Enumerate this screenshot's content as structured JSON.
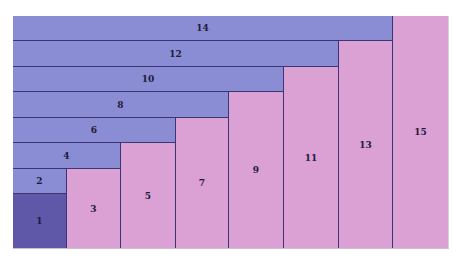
{
  "diagram": {
    "type": "geometric-series-proof",
    "colors": {
      "bar": "#8a8dd4",
      "column": "#dba0d4",
      "square": "#5f57a8",
      "border": "#3b3673"
    },
    "grid": {
      "columns": 8,
      "rows": 9
    },
    "square": {
      "label": "1"
    },
    "bars": [
      {
        "label": "14",
        "span_cols": 7,
        "row": 0
      },
      {
        "label": "12",
        "span_cols": 6,
        "row": 1
      },
      {
        "label": "10",
        "span_cols": 5,
        "row": 2
      },
      {
        "label": "8",
        "span_cols": 4,
        "row": 3
      },
      {
        "label": "6",
        "span_cols": 3,
        "row": 4
      },
      {
        "label": "4",
        "span_cols": 2,
        "row": 5
      },
      {
        "label": "2",
        "span_cols": 1,
        "row": 6
      }
    ],
    "columns": [
      {
        "label": "3",
        "col": 1,
        "top_row": 6
      },
      {
        "label": "5",
        "col": 2,
        "top_row": 5
      },
      {
        "label": "7",
        "col": 3,
        "top_row": 4
      },
      {
        "label": "9",
        "col": 4,
        "top_row": 3
      },
      {
        "label": "11",
        "col": 5,
        "top_row": 2
      },
      {
        "label": "13",
        "col": 6,
        "top_row": 1
      },
      {
        "label": "15",
        "col": 7,
        "top_row": 0
      }
    ]
  }
}
